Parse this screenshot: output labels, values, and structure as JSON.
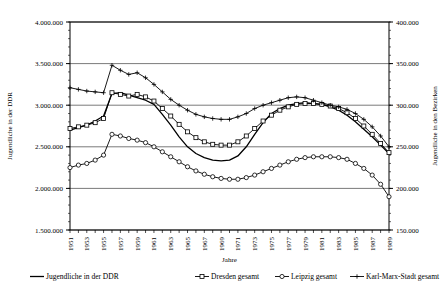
{
  "chart_data": {
    "type": "line",
    "title": "",
    "xlabel": "Jahre",
    "ylabel": "Jugendliche in der DDR",
    "ylabel_right": "Jugendliche in den Bezirken",
    "grid": true,
    "legend_position": "bottom",
    "xlim": [
      1951,
      1989
    ],
    "ylim": [
      1500000,
      4000000
    ],
    "ylim_right": [
      150000,
      400000
    ],
    "yticks": [
      "1.500.000",
      "2.000.000",
      "2.500.000",
      "3.000.000",
      "3.500.000",
      "4.000.000"
    ],
    "ytick_values": [
      1500000,
      2000000,
      2500000,
      3000000,
      3500000,
      4000000
    ],
    "yticks_right": [
      "150.000",
      "200.000",
      "250.000",
      "300.000",
      "350.000",
      "400.000"
    ],
    "ytick_values_right": [
      150000,
      200000,
      250000,
      300000,
      350000,
      400000
    ],
    "x": [
      1951,
      1952,
      1953,
      1954,
      1955,
      1956,
      1957,
      1958,
      1959,
      1960,
      1961,
      1962,
      1963,
      1964,
      1965,
      1966,
      1967,
      1968,
      1969,
      1970,
      1971,
      1972,
      1973,
      1974,
      1975,
      1976,
      1977,
      1978,
      1979,
      1980,
      1981,
      1982,
      1983,
      1984,
      1985,
      1986,
      1987,
      1988,
      1989
    ],
    "xtick_labels": [
      "1951",
      "1953",
      "1955",
      "1957",
      "1959",
      "1961",
      "1963",
      "1965",
      "1967",
      "1969",
      "1971",
      "1973",
      "1975",
      "1977",
      "1979",
      "1981",
      "1983",
      "1985",
      "1987",
      "1989"
    ],
    "series": [
      {
        "name": "Jugendliche in der DDR",
        "axis": "left",
        "marker": "none",
        "color": "#000000",
        "values": [
          2700000,
          2730000,
          2760000,
          2810000,
          2870000,
          3140000,
          3150000,
          3120000,
          3090000,
          3060000,
          3010000,
          2890000,
          2760000,
          2620000,
          2500000,
          2420000,
          2370000,
          2340000,
          2330000,
          2340000,
          2390000,
          2500000,
          2650000,
          2790000,
          2900000,
          2960000,
          3000000,
          3020000,
          3030000,
          3020000,
          3010000,
          2980000,
          2940000,
          2880000,
          2800000,
          2710000,
          2620000,
          2520000,
          2420000
        ]
      },
      {
        "name": "Dresden gesamt",
        "axis": "right",
        "marker": "square",
        "color": "#000000",
        "values": [
          272000,
          274000,
          276000,
          279000,
          284000,
          315000,
          313000,
          311000,
          313000,
          310000,
          305000,
          296000,
          287000,
          277000,
          268000,
          261000,
          256000,
          253000,
          252000,
          252000,
          256000,
          263000,
          272000,
          281000,
          288000,
          294000,
          298000,
          301000,
          302000,
          302000,
          301000,
          299000,
          296000,
          291000,
          284000,
          275000,
          265000,
          254000,
          243000
        ]
      },
      {
        "name": "Leipzig gesamt",
        "axis": "right",
        "marker": "circle",
        "color": "#000000",
        "values": [
          225000,
          228000,
          230000,
          234000,
          240000,
          265000,
          263000,
          260000,
          258000,
          255000,
          250000,
          244000,
          238000,
          232000,
          226000,
          221000,
          217000,
          214000,
          212000,
          211000,
          211000,
          213000,
          216000,
          220000,
          224000,
          228000,
          232000,
          235000,
          237000,
          238000,
          238000,
          238000,
          237000,
          235000,
          230000,
          224000,
          216000,
          205000,
          190000
        ]
      },
      {
        "name": "Karl-Marx-Stadt gesamt",
        "axis": "right",
        "marker": "plus",
        "color": "#000000",
        "values": [
          321000,
          319000,
          317000,
          316000,
          315000,
          348000,
          342000,
          337000,
          339000,
          333000,
          325000,
          316000,
          307000,
          300000,
          294000,
          289000,
          286000,
          284000,
          283000,
          283000,
          286000,
          290000,
          296000,
          300000,
          303000,
          306000,
          309000,
          310000,
          309000,
          306000,
          303000,
          300000,
          298000,
          295000,
          290000,
          283000,
          274000,
          263000,
          250000
        ]
      }
    ]
  },
  "legend": {
    "items": [
      {
        "label": "Jugendliche in der DDR",
        "marker": "none"
      },
      {
        "label": "Dresden gesamt",
        "marker": "square"
      },
      {
        "label": "Leipzig gesamt",
        "marker": "circle"
      },
      {
        "label": "Karl-Marx-Stadt gesamt",
        "marker": "plus"
      }
    ]
  }
}
